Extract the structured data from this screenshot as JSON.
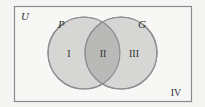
{
  "diagram": {
    "type": "venn",
    "universe_label": "U",
    "sets": [
      {
        "name": "P",
        "region_label": "I"
      },
      {
        "name": "G",
        "region_label": "III"
      }
    ],
    "intersection_label": "II",
    "outside_label": "IV",
    "colors": {
      "background": "#f4f4f2",
      "border": "#8a8a8a",
      "circle_fill": "#d6d6d4",
      "circle_stroke": "#8e8e8e",
      "intersection_fill": "#b9b9b7",
      "text": "#333333"
    }
  }
}
